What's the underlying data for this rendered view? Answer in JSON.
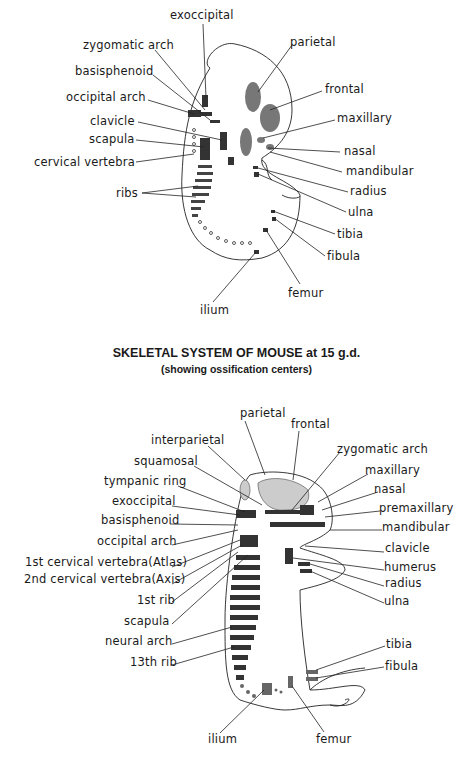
{
  "figure1": {
    "labels": [
      {
        "text": "exoccipital",
        "x": 170,
        "y": 17
      },
      {
        "text": "zygomatic arch",
        "x": 83,
        "y": 40
      },
      {
        "text": "basisphenoid",
        "x": 75,
        "y": 66
      },
      {
        "text": "occipital arch",
        "x": 66,
        "y": 91
      },
      {
        "text": "clavicle",
        "x": 90,
        "y": 116
      },
      {
        "text": "scapula",
        "x": 89,
        "y": 133
      },
      {
        "text": "cervical vertebra",
        "x": 34,
        "y": 156
      },
      {
        "text": "ribs",
        "x": 116,
        "y": 189
      },
      {
        "text": "parietal",
        "x": 290,
        "y": 37
      },
      {
        "text": "frontal",
        "x": 325,
        "y": 84
      },
      {
        "text": "maxillary",
        "x": 337,
        "y": 113
      },
      {
        "text": "nasal",
        "x": 344,
        "y": 146
      },
      {
        "text": "mandibular",
        "x": 346,
        "y": 166
      },
      {
        "text": "radius",
        "x": 350,
        "y": 186
      },
      {
        "text": "ulna",
        "x": 348,
        "y": 207
      },
      {
        "text": "tibia",
        "x": 337,
        "y": 229
      },
      {
        "text": "fibula",
        "x": 327,
        "y": 251
      },
      {
        "text": "femur",
        "x": 288,
        "y": 288
      },
      {
        "text": "ilium",
        "x": 200,
        "y": 306
      }
    ]
  },
  "caption": {
    "title": "SKELETAL SYSTEM OF MOUSE at 15 g.d.",
    "subtitle": "(showing ossification centers)"
  },
  "figure2": {
    "labels": [
      {
        "text": "parietal",
        "x": 240,
        "y": 414
      },
      {
        "text": "frontal",
        "x": 291,
        "y": 425
      },
      {
        "text": "interparietal",
        "x": 151,
        "y": 439
      },
      {
        "text": "zygomatic arch",
        "x": 337,
        "y": 445
      },
      {
        "text": "squamosal",
        "x": 134,
        "y": 460
      },
      {
        "text": "maxillary",
        "x": 365,
        "y": 467
      },
      {
        "text": "tympanic ring",
        "x": 104,
        "y": 480
      },
      {
        "text": "nasal",
        "x": 374,
        "y": 485
      },
      {
        "text": "exoccipital",
        "x": 112,
        "y": 501
      },
      {
        "text": "premaxillary",
        "x": 379,
        "y": 504
      },
      {
        "text": "basisphenoid",
        "x": 101,
        "y": 521
      },
      {
        "text": "mandibular",
        "x": 382,
        "y": 524
      },
      {
        "text": "occipital arch",
        "x": 97,
        "y": 541
      },
      {
        "text": "clavicle",
        "x": 385,
        "y": 545
      },
      {
        "text": "1st cervical vertebra(Atlas)",
        "x": 25,
        "y": 563
      },
      {
        "text": "humerus",
        "x": 384,
        "y": 564
      },
      {
        "text": "2nd cervical vertebra(Axis)",
        "x": 24,
        "y": 580
      },
      {
        "text": "radius",
        "x": 385,
        "y": 580
      },
      {
        "text": "ulna",
        "x": 384,
        "y": 598
      },
      {
        "text": "1st rib",
        "x": 137,
        "y": 601
      },
      {
        "text": "scapula",
        "x": 124,
        "y": 621
      },
      {
        "text": "neural arch",
        "x": 105,
        "y": 641
      },
      {
        "text": "tibia",
        "x": 386,
        "y": 641
      },
      {
        "text": "fibula",
        "x": 385,
        "y": 664
      },
      {
        "text": "13th rib",
        "x": 130,
        "y": 662
      },
      {
        "text": "ilium",
        "x": 208,
        "y": 737
      },
      {
        "text": "femur",
        "x": 316,
        "y": 737
      }
    ]
  }
}
